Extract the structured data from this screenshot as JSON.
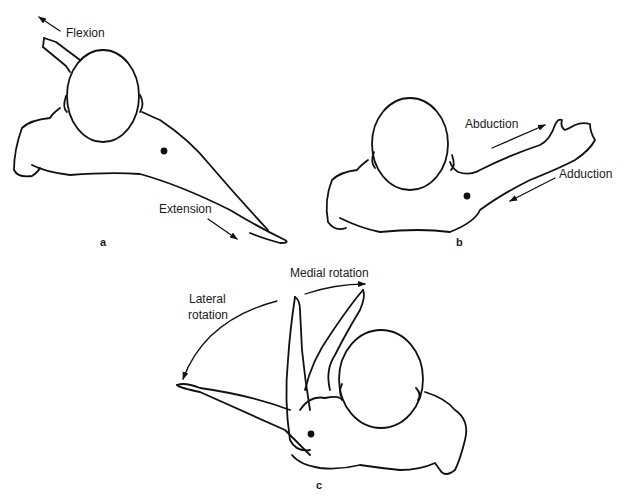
{
  "figure": {
    "panels": [
      {
        "id": "a",
        "letter": "a",
        "labels": {
          "flexion": "Flexion",
          "extension": "Extension"
        }
      },
      {
        "id": "b",
        "letter": "b",
        "labels": {
          "abduction": "Abduction",
          "adduction": "Adduction"
        }
      },
      {
        "id": "c",
        "letter": "c",
        "labels": {
          "medial": "Medial rotation",
          "lateral_line1": "Lateral",
          "lateral_line2": "rotation"
        }
      }
    ],
    "colors": {
      "line": "#111111",
      "background": "#ffffff"
    }
  }
}
